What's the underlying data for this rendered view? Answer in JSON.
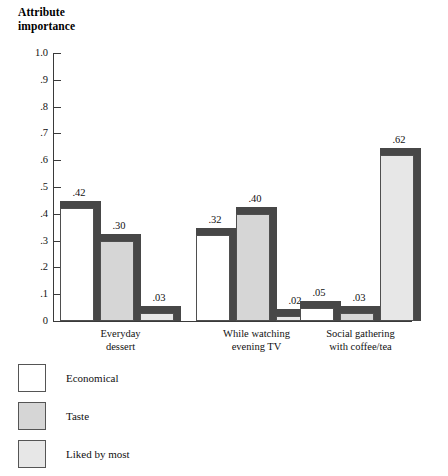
{
  "chart_data": {
    "type": "bar",
    "title": "Attribute\nimportance",
    "xlabel": "",
    "ylabel": "Attribute importance",
    "ylim": [
      0,
      1.0
    ],
    "grid": false,
    "legend_position": "bottom-left",
    "categories": [
      "Everyday\ndessert",
      "While watching\nevening TV",
      "Social gathering\nwith coffee/tea"
    ],
    "series": [
      {
        "name": "Economical",
        "swatch": "white",
        "values": [
          0.42,
          0.32,
          0.05
        ],
        "labels": [
          ".42",
          ".32",
          ".05"
        ]
      },
      {
        "name": "Taste",
        "swatch": "mid",
        "values": [
          0.3,
          0.4,
          0.03
        ],
        "labels": [
          ".30",
          ".40",
          ".03"
        ]
      },
      {
        "name": "Liked by most",
        "swatch": "light",
        "values": [
          0.03,
          0.02,
          0.62
        ],
        "labels": [
          ".03",
          ".02",
          ".62"
        ]
      }
    ],
    "yticks": [
      "1.0",
      ".9",
      ".8",
      ".7",
      ".6",
      ".5",
      ".4",
      ".3",
      ".2",
      ".1",
      "0"
    ],
    "ytick_values": [
      1.0,
      0.9,
      0.8,
      0.7,
      0.6,
      0.5,
      0.4,
      0.3,
      0.2,
      0.1,
      0.0
    ]
  },
  "colors": {
    "background": "#ffffff",
    "axis": "#3a3a3a",
    "bar_shadow": "#474747",
    "bar_outline": "#4f4f4f",
    "fill_white": "#ffffff",
    "fill_mid": "#d6d6d6",
    "fill_light": "#e7e7e7",
    "text": "#111111"
  },
  "legend": {
    "items": [
      {
        "label": "Economical",
        "swatch": "white"
      },
      {
        "label": "Taste",
        "swatch": "mid"
      },
      {
        "label": "Liked by most",
        "swatch": "light"
      }
    ]
  }
}
